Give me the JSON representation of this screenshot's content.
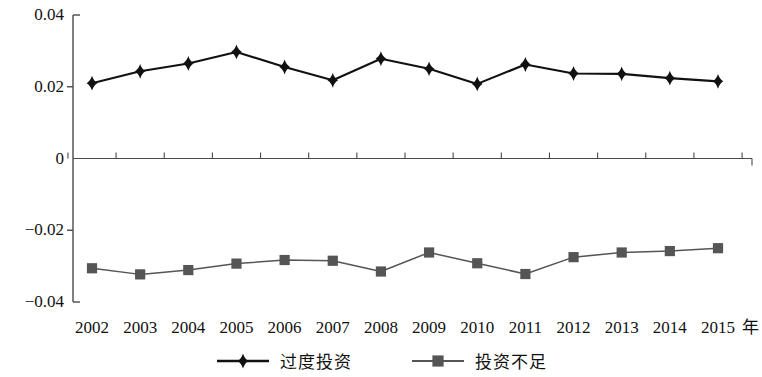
{
  "chart_data": {
    "type": "line",
    "title": "",
    "subtitle": "",
    "xlabel": "年",
    "ylabel": "",
    "grid": false,
    "legend_position": "bottom-center",
    "ylim": [
      -0.04,
      0.04
    ],
    "y_ticks": [
      0.04,
      0.02,
      0,
      -0.02,
      -0.04
    ],
    "y_tick_labels": [
      "0.04",
      "0.02",
      "0",
      "−0.02",
      "−0.04"
    ],
    "categories": [
      "2002",
      "2003",
      "2004",
      "2005",
      "2006",
      "2007",
      "2008",
      "2009",
      "2010",
      "2011",
      "2012",
      "2013",
      "2014",
      "2015"
    ],
    "x_axis_unit": "年",
    "series": [
      {
        "name": "过度投资",
        "marker": "diamond",
        "color": "#111111",
        "values": [
          0.021,
          0.0243,
          0.0265,
          0.0297,
          0.0255,
          0.0218,
          0.0278,
          0.025,
          0.0208,
          0.0262,
          0.0237,
          0.0236,
          0.0224,
          0.0215
        ]
      },
      {
        "name": "投资不足",
        "marker": "square",
        "color": "#555555",
        "values": [
          -0.0306,
          -0.0323,
          -0.0311,
          -0.0293,
          -0.0283,
          -0.0285,
          -0.0315,
          -0.0262,
          -0.0292,
          -0.0322,
          -0.0275,
          -0.0262,
          -0.0258,
          -0.025
        ]
      }
    ]
  },
  "legend": {
    "items": [
      {
        "label": "过度投资",
        "marker": "diamond",
        "color": "#111111"
      },
      {
        "label": "投资不足",
        "marker": "square",
        "color": "#555555"
      }
    ]
  }
}
